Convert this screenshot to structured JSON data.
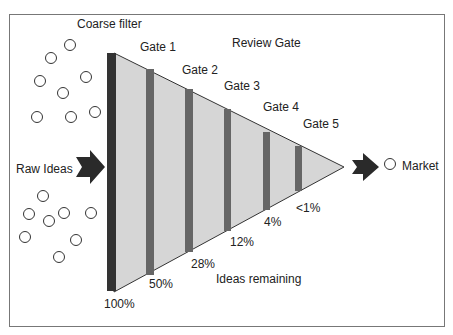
{
  "figure": {
    "labels": {
      "coarse_filter": "Coarse filter",
      "review_gate": "Review Gate",
      "raw_ideas": "Raw Ideas",
      "market": "Market",
      "ideas_remaining": "Ideas remaining"
    },
    "gates": [
      {
        "label": "Gate 1",
        "remaining": "50%"
      },
      {
        "label": "Gate 2",
        "remaining": "28%"
      },
      {
        "label": "Gate 3",
        "remaining": "12%"
      },
      {
        "label": "Gate 4",
        "remaining": "4%"
      },
      {
        "label": "Gate 5",
        "remaining": "<1%"
      }
    ],
    "start_remaining": "100%",
    "colors": {
      "funnel_fill": "#d6d6d6",
      "coarse_filter_bar": "#333333",
      "gate_bar": "#666666",
      "arrow": "#2a2a2a",
      "border": "#777777"
    }
  }
}
